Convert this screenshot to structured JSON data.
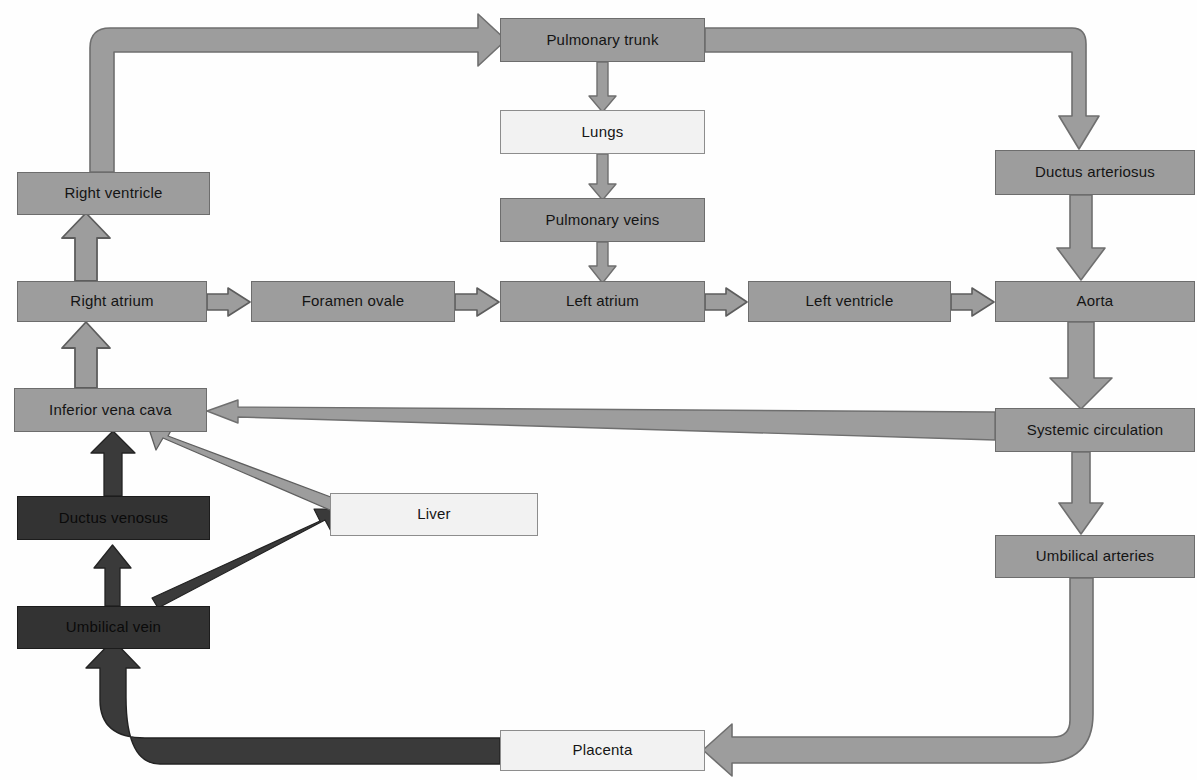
{
  "diagram": {
    "colors": {
      "arterial_gray": "#9d9d9d",
      "venous_dark": "#333333",
      "organ_light": "#f2f2f2",
      "outline": "#6d6d6d",
      "background": "#fefefe"
    },
    "top_partial_text": "",
    "nodes": [
      {
        "id": "pulmonary_trunk",
        "label": "Pulmonary trunk",
        "style": "gray",
        "x": 500,
        "y": 18,
        "w": 205,
        "h": 44
      },
      {
        "id": "lungs",
        "label": "Lungs",
        "style": "light",
        "x": 500,
        "y": 110,
        "w": 205,
        "h": 44
      },
      {
        "id": "pulmonary_veins",
        "label": "Pulmonary veins",
        "style": "gray",
        "x": 500,
        "y": 198,
        "w": 205,
        "h": 44
      },
      {
        "id": "ductus_arteriosus",
        "label": "Ductus arteriosus",
        "style": "gray",
        "x": 995,
        "y": 150,
        "w": 200,
        "h": 45
      },
      {
        "id": "right_ventricle",
        "label": "Right ventricle",
        "style": "gray",
        "x": 17,
        "y": 172,
        "w": 193,
        "h": 43
      },
      {
        "id": "right_atrium",
        "label": "Right atrium",
        "style": "gray",
        "x": 17,
        "y": 281,
        "w": 190,
        "h": 41
      },
      {
        "id": "foramen_ovale",
        "label": "Foramen ovale",
        "style": "gray",
        "x": 251,
        "y": 281,
        "w": 204,
        "h": 41
      },
      {
        "id": "left_atrium",
        "label": "Left atrium",
        "style": "gray",
        "x": 500,
        "y": 281,
        "w": 205,
        "h": 41
      },
      {
        "id": "left_ventricle",
        "label": "Left ventricle",
        "style": "gray",
        "x": 748,
        "y": 281,
        "w": 203,
        "h": 41
      },
      {
        "id": "aorta",
        "label": "Aorta",
        "style": "gray",
        "x": 995,
        "y": 281,
        "w": 200,
        "h": 41
      },
      {
        "id": "inferior_vena_cava",
        "label": "Inferior vena cava",
        "style": "gray",
        "x": 14,
        "y": 388,
        "w": 193,
        "h": 44
      },
      {
        "id": "systemic_circulation",
        "label": "Systemic circulation",
        "style": "gray",
        "x": 995,
        "y": 408,
        "w": 200,
        "h": 44
      },
      {
        "id": "ductus_venosus",
        "label": "Ductus venosus",
        "style": "dark",
        "x": 17,
        "y": 496,
        "w": 193,
        "h": 44
      },
      {
        "id": "liver",
        "label": "Liver",
        "style": "light",
        "x": 330,
        "y": 493,
        "w": 208,
        "h": 43
      },
      {
        "id": "umbilical_arteries",
        "label": "Umbilical arteries",
        "style": "gray",
        "x": 995,
        "y": 535,
        "w": 200,
        "h": 43
      },
      {
        "id": "umbilical_vein",
        "label": "Umbilical vein",
        "style": "dark",
        "x": 17,
        "y": 606,
        "w": 193,
        "h": 43
      },
      {
        "id": "placenta",
        "label": "Placenta",
        "style": "light",
        "x": 500,
        "y": 730,
        "w": 205,
        "h": 41
      }
    ],
    "edges": [
      {
        "from": "right_ventricle",
        "to": "pulmonary_trunk",
        "kind": "elbow-up-right",
        "color": "#9d9d9d"
      },
      {
        "from": "pulmonary_trunk",
        "to": "lungs",
        "kind": "straight-down",
        "color": "#9d9d9d"
      },
      {
        "from": "lungs",
        "to": "pulmonary_veins",
        "kind": "straight-down",
        "color": "#9d9d9d"
      },
      {
        "from": "pulmonary_veins",
        "to": "left_atrium",
        "kind": "straight-down",
        "color": "#9d9d9d"
      },
      {
        "from": "pulmonary_trunk",
        "to": "ductus_arteriosus",
        "kind": "elbow-right-down",
        "color": "#9d9d9d"
      },
      {
        "from": "ductus_arteriosus",
        "to": "aorta",
        "kind": "straight-down",
        "color": "#9d9d9d"
      },
      {
        "from": "right_atrium",
        "to": "right_ventricle",
        "kind": "straight-up",
        "color": "#9d9d9d"
      },
      {
        "from": "right_atrium",
        "to": "foramen_ovale",
        "kind": "straight-right",
        "color": "#9d9d9d"
      },
      {
        "from": "foramen_ovale",
        "to": "left_atrium",
        "kind": "straight-right",
        "color": "#9d9d9d"
      },
      {
        "from": "left_atrium",
        "to": "left_ventricle",
        "kind": "straight-right",
        "color": "#9d9d9d"
      },
      {
        "from": "left_ventricle",
        "to": "aorta",
        "kind": "straight-right",
        "color": "#9d9d9d"
      },
      {
        "from": "inferior_vena_cava",
        "to": "right_atrium",
        "kind": "straight-up",
        "color": "#9d9d9d"
      },
      {
        "from": "aorta",
        "to": "systemic_circulation",
        "kind": "straight-down",
        "color": "#9d9d9d"
      },
      {
        "from": "systemic_circulation",
        "to": "inferior_vena_cava",
        "kind": "tapered-left",
        "color": "#9d9d9d"
      },
      {
        "from": "systemic_circulation",
        "to": "umbilical_arteries",
        "kind": "straight-down",
        "color": "#9d9d9d"
      },
      {
        "from": "umbilical_arteries",
        "to": "placenta",
        "kind": "elbow-down-left",
        "color": "#9d9d9d"
      },
      {
        "from": "placenta",
        "to": "umbilical_vein",
        "kind": "elbow-left-up",
        "color": "#333333"
      },
      {
        "from": "umbilical_vein",
        "to": "ductus_venosus",
        "kind": "straight-up",
        "color": "#333333"
      },
      {
        "from": "ductus_venosus",
        "to": "inferior_vena_cava",
        "kind": "straight-up",
        "color": "#333333"
      },
      {
        "from": "umbilical_vein",
        "to": "liver",
        "kind": "diagonal-up-right",
        "color": "#333333"
      },
      {
        "from": "liver",
        "to": "inferior_vena_cava",
        "kind": "diagonal-up-left",
        "color": "#9d9d9d"
      }
    ]
  }
}
